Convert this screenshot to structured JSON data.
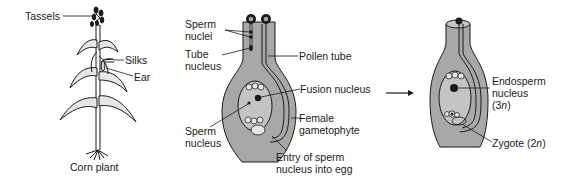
{
  "figure": {
    "colors": {
      "ink": "#1a1a1a",
      "tissue": "#a8a8a8",
      "sac": "#c4c4c4",
      "background": "#ffffff"
    },
    "panel_corn": {
      "caption": "Corn plant",
      "labels": {
        "tassels": "Tassels",
        "silks": "Silks",
        "ear": "Ear"
      }
    },
    "panel_pollination": {
      "labels": {
        "sperm_nuclei_1": "Sperm",
        "sperm_nuclei_2": "nuclei",
        "tube_nucleus_1": "Tube",
        "tube_nucleus_2": "nucleus",
        "pollen_tube": "Pollen tube",
        "fusion_nucleus": "Fusion nucleus",
        "sperm_nucleus_1": "Sperm",
        "sperm_nucleus_2": "nucleus",
        "female_gametophyte_1": "Female",
        "female_gametophyte_2": "gametophyte",
        "entry_1": "Entry of sperm",
        "entry_2": "nucleus into egg"
      }
    },
    "arrow": {
      "icon": "right-arrow-icon"
    },
    "panel_fertilized": {
      "labels": {
        "endosperm_1": "Endosperm",
        "endosperm_2": "nucleus",
        "endosperm_ploidy_pre": "(3",
        "endosperm_ploidy_n": "n",
        "endosperm_ploidy_post": ")",
        "zygote_pre": "Zygote (2",
        "zygote_n": "n",
        "zygote_post": ")"
      }
    }
  }
}
